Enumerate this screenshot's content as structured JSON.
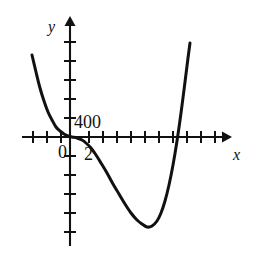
{
  "figure": {
    "name": "polynomial-graph",
    "background_color": "#ffffff",
    "ink_color": "#111111"
  },
  "chart_data": {
    "type": "line",
    "title": "",
    "subtitle": "",
    "xlabel": "x",
    "ylabel": "y",
    "grid": false,
    "legend": null,
    "annotations": [
      {
        "text": "400",
        "role": "y-axis-value-label",
        "x_px": 73,
        "y_px": 123
      },
      {
        "text": "0",
        "role": "origin-label",
        "x_px": 63,
        "y_px": 153
      },
      {
        "text": "2",
        "role": "x-axis-value-label",
        "x_px": 88,
        "y_px": 155
      }
    ],
    "axis_labels": {
      "x": "x",
      "y": "y"
    },
    "tick_labels": {
      "x": [
        "0",
        "2"
      ],
      "y": [
        "400"
      ]
    },
    "x_axis": {
      "pixel_y": 137,
      "pixel_start": 22,
      "pixel_end": 228,
      "arrow": "right",
      "tick_spacing_px": 14,
      "tick_positions_px": [
        33,
        47,
        61,
        89,
        103,
        117,
        131,
        145,
        159,
        173,
        187,
        201,
        215
      ]
    },
    "y_axis": {
      "pixel_x": 70,
      "pixel_start": 20,
      "pixel_end": 246,
      "arrow": "up",
      "tick_spacing_px": 19,
      "tick_positions_px": [
        42,
        61,
        80,
        99,
        118,
        156,
        175,
        194,
        213,
        232
      ]
    },
    "origin_px": {
      "x": 70,
      "y": 137
    },
    "curve_points_px": [
      [
        32,
        55
      ],
      [
        36,
        72
      ],
      [
        40,
        88
      ],
      [
        44,
        101
      ],
      [
        48,
        112
      ],
      [
        52,
        120
      ],
      [
        56,
        127
      ],
      [
        60,
        131
      ],
      [
        64,
        134
      ],
      [
        68,
        136
      ],
      [
        72,
        137
      ],
      [
        77,
        138
      ],
      [
        82,
        140
      ],
      [
        86,
        143
      ],
      [
        91,
        148
      ],
      [
        96,
        155
      ],
      [
        101,
        163
      ],
      [
        107,
        173
      ],
      [
        113,
        184
      ],
      [
        119,
        194
      ],
      [
        125,
        204
      ],
      [
        131,
        213
      ],
      [
        137,
        220
      ],
      [
        142,
        224
      ],
      [
        147,
        227
      ],
      [
        152,
        226
      ],
      [
        157,
        221
      ],
      [
        161,
        213
      ],
      [
        165,
        201
      ],
      [
        169,
        185
      ],
      [
        173,
        165
      ],
      [
        177,
        141
      ],
      [
        181,
        113
      ],
      [
        185,
        82
      ],
      [
        188,
        58
      ],
      [
        190,
        43
      ]
    ],
    "curve_features": {
      "local_flat_point_px": [
        70,
        137
      ],
      "x_intercepts_px": [
        70,
        167
      ],
      "local_minimum_px": [
        147,
        227
      ],
      "left_branch_top_px": [
        32,
        55
      ],
      "right_branch_top_px": [
        190,
        43
      ]
    }
  }
}
